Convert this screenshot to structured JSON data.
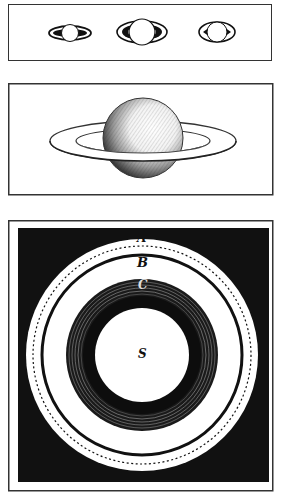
{
  "figure": {
    "panels": [
      {
        "id": "phases",
        "description": "Three small views of Saturn showing ring appearances (ansae)"
      },
      {
        "id": "saturn-ringed",
        "description": "Engraved Saturn with ring in perspective"
      },
      {
        "id": "ring-plan",
        "description": "Plan view of Saturn's rings"
      }
    ],
    "ring_labels": {
      "a": "A",
      "b": "B",
      "c": "C",
      "s": "S"
    },
    "colors": {
      "ink": "#111111",
      "paper": "#ffffff",
      "frame": "#333333"
    }
  }
}
